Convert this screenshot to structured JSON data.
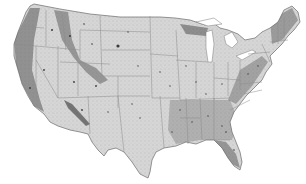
{
  "map": {
    "type": "dot-density",
    "region": "Contiguous United States",
    "colors": {
      "background": "#ffffff",
      "land": "#d9d9d9",
      "border": "#8a8a8a",
      "dot": "#3a3a3a",
      "dense": "#2b2b2b"
    }
  }
}
